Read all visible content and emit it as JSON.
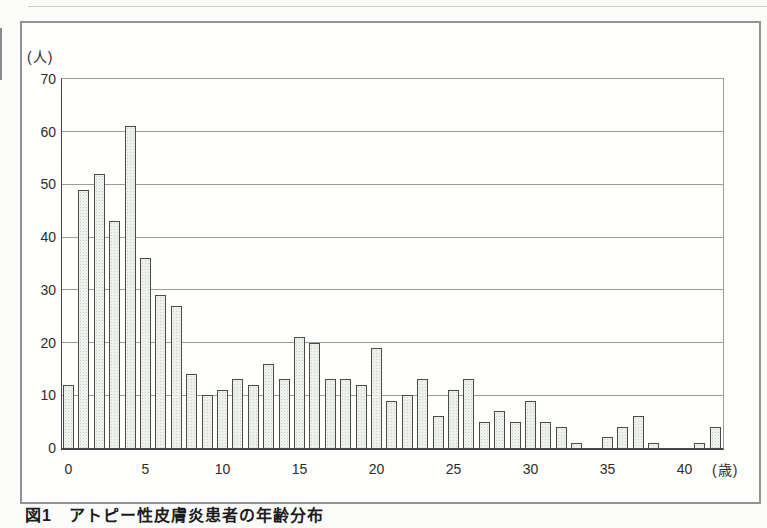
{
  "page": {
    "caption": "図1　アトピー性皮膚炎患者の年齢分布"
  },
  "chart_data": {
    "type": "bar",
    "title": "",
    "y_unit_label": "(人)",
    "x_unit_label": "(歳)",
    "x": [
      0,
      1,
      2,
      3,
      4,
      5,
      6,
      7,
      8,
      9,
      10,
      11,
      12,
      13,
      14,
      15,
      16,
      17,
      18,
      19,
      20,
      21,
      22,
      23,
      24,
      25,
      26,
      27,
      28,
      29,
      30,
      31,
      32,
      33,
      34,
      35,
      36,
      37,
      38,
      39,
      40,
      41,
      42
    ],
    "values": [
      12,
      49,
      52,
      43,
      61,
      36,
      29,
      27,
      14,
      10,
      11,
      13,
      12,
      16,
      13,
      21,
      20,
      13,
      13,
      12,
      19,
      9,
      10,
      13,
      6,
      11,
      13,
      5,
      7,
      5,
      9,
      5,
      4,
      1,
      0,
      2,
      4,
      6,
      1,
      0,
      0,
      1,
      4
    ],
    "yticks": [
      0,
      10,
      20,
      30,
      40,
      50,
      60,
      70
    ],
    "xticks": [
      0,
      5,
      10,
      15,
      20,
      25,
      30,
      35,
      40
    ],
    "ylim": [
      0,
      70
    ],
    "grid": "horizontal",
    "legend": "none",
    "colors": {
      "bar_fill": "#eff1ec",
      "bar_dot": "#c9d0c4",
      "bar_border": "#4a4a4a",
      "gridline": "#9c9c9c",
      "axis": "#454545",
      "box_border": "#939393",
      "text": "#2d2d2d"
    }
  }
}
